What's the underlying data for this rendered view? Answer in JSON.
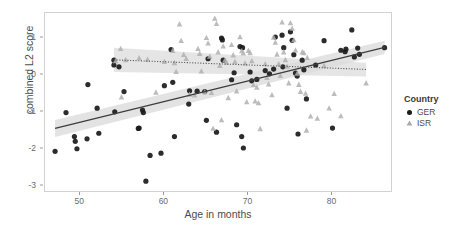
{
  "chart_data": {
    "type": "scatter",
    "title": "",
    "xlabel": "Age in months",
    "ylabel": "combined L2 score",
    "xlim": [
      45.8,
      87.2
    ],
    "ylim": [
      -3.2,
      1.68
    ],
    "xticks": [
      50,
      60,
      70,
      80
    ],
    "yticks": [
      1,
      0,
      -1,
      -2,
      -3
    ],
    "xtick_labels": [
      "50",
      "60",
      "70",
      "80"
    ],
    "ytick_labels": [
      "1",
      "0",
      "-1",
      "-2",
      "-3"
    ],
    "grid": false,
    "legend": {
      "title": "Country",
      "position": "right",
      "entries": [
        {
          "name": "GER",
          "marker": "circle",
          "color": "#1a1a1a"
        },
        {
          "name": "ISR",
          "marker": "triangle",
          "color": "#aaaaaa"
        }
      ]
    },
    "series": [
      {
        "name": "GER",
        "marker": "circle",
        "color": "#1a1a1a",
        "fit": {
          "type": "linear",
          "linestyle": "solid",
          "color": "#3d3d3d",
          "x": [
            47.0,
            86.2
          ],
          "y": [
            -1.45,
            0.75
          ],
          "ci_upper": [
            -1.22,
            0.93
          ],
          "ci_lower": [
            -1.68,
            0.57
          ],
          "ci_color": "#d9d9d9"
        },
        "points": [
          [
            47.0,
            -2.07
          ],
          [
            48.3,
            -1.02
          ],
          [
            49.3,
            -1.67
          ],
          [
            49.4,
            -1.8
          ],
          [
            49.6,
            -2.0
          ],
          [
            50.9,
            -0.26
          ],
          [
            50.8,
            -1.73
          ],
          [
            52.0,
            -0.9
          ],
          [
            52.2,
            -1.58
          ],
          [
            54.0,
            0.4
          ],
          [
            54.0,
            0.27
          ],
          [
            54.1,
            -1.0
          ],
          [
            54.6,
            0.22
          ],
          [
            55.2,
            -0.45
          ],
          [
            56.9,
            -1.45
          ],
          [
            57.0,
            -1.44
          ],
          [
            57.4,
            -0.95
          ],
          [
            57.5,
            -1.02
          ],
          [
            57.8,
            -2.88
          ],
          [
            58.3,
            -2.18
          ],
          [
            59.6,
            -2.12
          ],
          [
            60.0,
            -0.29
          ],
          [
            60.8,
            0.69
          ],
          [
            61.0,
            -0.2
          ],
          [
            61.2,
            -1.67
          ],
          [
            62.9,
            -0.79
          ],
          [
            63.0,
            -0.43
          ],
          [
            63.9,
            -0.44
          ],
          [
            64.8,
            -0.45
          ],
          [
            65.0,
            -1.23
          ],
          [
            65.2,
            0.44
          ],
          [
            66.2,
            -1.55
          ],
          [
            66.8,
            1.0
          ],
          [
            66.9,
            0.95
          ],
          [
            67.0,
            0.4
          ],
          [
            68.0,
            -0.13
          ],
          [
            68.3,
            0.06
          ],
          [
            68.6,
            -1.35
          ],
          [
            69.0,
            0.77
          ],
          [
            69.3,
            0.74
          ],
          [
            69.2,
            -1.67
          ],
          [
            69.4,
            -1.98
          ],
          [
            70.2,
            0.08
          ],
          [
            70.4,
            -0.16
          ],
          [
            71.0,
            -0.12
          ],
          [
            72.0,
            0.12
          ],
          [
            72.5,
            0.03
          ],
          [
            73.0,
            0.16
          ],
          [
            73.2,
            1.03
          ],
          [
            74.0,
            1.08
          ],
          [
            74.2,
            0.74
          ],
          [
            74.1,
            0.22
          ],
          [
            74.6,
            -0.9
          ],
          [
            75.0,
            1.17
          ],
          [
            75.2,
            0.94
          ],
          [
            75.4,
            0.55
          ],
          [
            75.6,
            0.05
          ],
          [
            75.8,
            -0.03
          ],
          [
            75.9,
            -1.6
          ],
          [
            76.4,
            0.4
          ],
          [
            76.6,
            0.14
          ],
          [
            76.9,
            -0.65
          ],
          [
            78.0,
            0.27
          ],
          [
            79.0,
            0.93
          ],
          [
            80.0,
            -1.44
          ],
          [
            81.0,
            0.67
          ],
          [
            81.5,
            0.63
          ],
          [
            81.6,
            0.7
          ],
          [
            82.3,
            1.22
          ],
          [
            82.6,
            0.49
          ],
          [
            83.0,
            0.73
          ],
          [
            83.2,
            0.56
          ],
          [
            86.2,
            0.74
          ]
        ]
      },
      {
        "name": "ISR",
        "marker": "triangle",
        "color": "#b0b0b0",
        "fit": {
          "type": "linear",
          "linestyle": "dotted",
          "color": "#555555",
          "x": [
            54.0,
            84.0
          ],
          "y": [
            0.41,
            0.15
          ],
          "ci_upper": [
            0.74,
            0.33
          ],
          "ci_lower": [
            0.08,
            -0.04
          ],
          "ci_color": "#dcdcdc"
        },
        "points": [
          [
            54.2,
            0.38
          ],
          [
            54.8,
            0.71
          ],
          [
            54.9,
            -0.6
          ],
          [
            55.4,
            0.41
          ],
          [
            57.0,
            0.46
          ],
          [
            58.0,
            0.42
          ],
          [
            59.0,
            -0.47
          ],
          [
            60.0,
            0.36
          ],
          [
            61.0,
            0.66
          ],
          [
            61.2,
            0.33
          ],
          [
            61.4,
            0.09
          ],
          [
            61.8,
            1.38
          ],
          [
            62.0,
            0.93
          ],
          [
            62.3,
            0.55
          ],
          [
            62.6,
            0.44
          ],
          [
            63.0,
            -0.53
          ],
          [
            63.6,
            -0.55
          ],
          [
            64.0,
            0.71
          ],
          [
            64.2,
            0.58
          ],
          [
            64.4,
            0.1
          ],
          [
            64.8,
            -0.46
          ],
          [
            65.0,
            1.01
          ],
          [
            65.2,
            0.86
          ],
          [
            65.4,
            0.5
          ],
          [
            65.6,
            -0.48
          ],
          [
            65.8,
            -1.45
          ],
          [
            66.0,
            1.53
          ],
          [
            66.2,
            1.39
          ],
          [
            66.4,
            0.62
          ],
          [
            66.6,
            0.25
          ],
          [
            66.8,
            -1.22
          ],
          [
            67.0,
            0.78
          ],
          [
            67.2,
            0.4
          ],
          [
            67.4,
            0.34
          ],
          [
            67.6,
            -0.62
          ],
          [
            68.0,
            0.82
          ],
          [
            68.2,
            0.54
          ],
          [
            68.4,
            0.36
          ],
          [
            68.6,
            -0.44
          ],
          [
            69.0,
            1.03
          ],
          [
            69.2,
            0.65
          ],
          [
            69.4,
            0.59
          ],
          [
            69.6,
            0.32
          ],
          [
            69.8,
            -0.73
          ],
          [
            70.0,
            0.66
          ],
          [
            70.2,
            0.6
          ],
          [
            70.4,
            0.38
          ],
          [
            70.6,
            -0.27
          ],
          [
            70.8,
            -0.71
          ],
          [
            71.0,
            -0.34
          ],
          [
            71.2,
            -0.76
          ],
          [
            71.4,
            -1.46
          ],
          [
            72.0,
            0.3
          ],
          [
            72.2,
            -0.07
          ],
          [
            72.4,
            -0.25
          ],
          [
            72.8,
            -0.54
          ],
          [
            73.0,
            1.02
          ],
          [
            73.2,
            0.88
          ],
          [
            73.4,
            0.56
          ],
          [
            73.6,
            0.3
          ],
          [
            73.8,
            -0.02
          ],
          [
            74.0,
            1.43
          ],
          [
            74.2,
            0.62
          ],
          [
            74.4,
            0.41
          ],
          [
            74.6,
            0.23
          ],
          [
            74.8,
            -0.22
          ],
          [
            75.0,
            1.41
          ],
          [
            75.2,
            1.26
          ],
          [
            75.4,
            0.95
          ],
          [
            75.6,
            0.67
          ],
          [
            75.8,
            0.04
          ],
          [
            76.0,
            -0.26
          ],
          [
            76.2,
            -0.45
          ],
          [
            76.4,
            0.62
          ],
          [
            76.6,
            0.6
          ],
          [
            76.8,
            -0.5
          ],
          [
            76.9,
            -1.5
          ],
          [
            77.0,
            0.47
          ],
          [
            77.4,
            -1.12
          ],
          [
            78.2,
            -1.18
          ],
          [
            79.0,
            0.25
          ],
          [
            79.6,
            -0.9
          ],
          [
            80.2,
            -0.51
          ],
          [
            81.0,
            -1.11
          ],
          [
            84.0,
            -0.22
          ]
        ]
      }
    ]
  },
  "figure": {
    "background": "#ffffff",
    "panel_background": "#ffffff",
    "panel_border": "#d2d2d2",
    "tick_color": "#6b6b6b",
    "axis_label_color": "#4d4d4d"
  }
}
